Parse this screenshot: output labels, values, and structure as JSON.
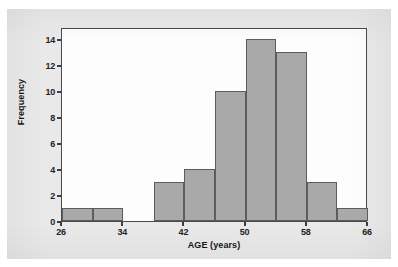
{
  "chart_data": {
    "type": "bar",
    "title": "",
    "subtitle": "",
    "xlabel": "AGE (years)",
    "ylabel": "Frequency",
    "xlim": [
      26,
      66
    ],
    "ylim": [
      0,
      14.9
    ],
    "grid": false,
    "legend": null,
    "bin_width": 4,
    "bin_edges": [
      26,
      30,
      34,
      38,
      42,
      46,
      50,
      54,
      58,
      62,
      66
    ],
    "categories": [
      "26-30",
      "30-34",
      "34-38",
      "38-42",
      "42-46",
      "46-50",
      "50-54",
      "54-58",
      "58-62",
      "62-66"
    ],
    "values": [
      1,
      1,
      0,
      3,
      4,
      10,
      14,
      13,
      3,
      1
    ],
    "bars": [
      {
        "bin_start": 26,
        "bin_end": 30,
        "value": 1
      },
      {
        "bin_start": 30,
        "bin_end": 34,
        "value": 1
      },
      {
        "bin_start": 34,
        "bin_end": 38,
        "value": 0
      },
      {
        "bin_start": 38,
        "bin_end": 42,
        "value": 3
      },
      {
        "bin_start": 42,
        "bin_end": 46,
        "value": 4
      },
      {
        "bin_start": 46,
        "bin_end": 50,
        "value": 10
      },
      {
        "bin_start": 50,
        "bin_end": 54,
        "value": 14
      },
      {
        "bin_start": 54,
        "bin_end": 58,
        "value": 13
      },
      {
        "bin_start": 58,
        "bin_end": 62,
        "value": 3
      },
      {
        "bin_start": 62,
        "bin_end": 66,
        "value": 1
      }
    ],
    "xticks": [
      26,
      34,
      42,
      50,
      58,
      66
    ],
    "xtick_labels": [
      "26",
      "34",
      "42",
      "50",
      "58",
      "66"
    ],
    "yticks": [
      0,
      2,
      4,
      6,
      8,
      10,
      12,
      14
    ],
    "ytick_labels": [
      "0",
      "2",
      "4",
      "6",
      "8",
      "10",
      "12",
      "14"
    ],
    "colors": {
      "bar_fill": "#a9a9a9",
      "bar_edge": "#5c5c5c",
      "axis": "#3d3d3d",
      "plot_background": "#fdfdfd",
      "figure_background": "#e9e9e9",
      "text": "#161616"
    }
  }
}
